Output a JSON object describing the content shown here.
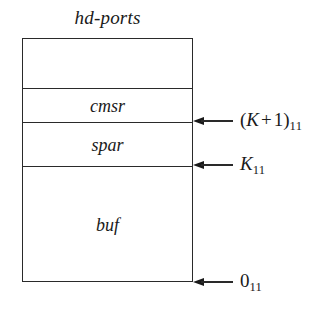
{
  "diagram": {
    "title": "hd-ports",
    "segments": [
      {
        "name": "unlabeled-top",
        "label": ""
      },
      {
        "name": "cmsr",
        "label": "cmsr"
      },
      {
        "name": "spar",
        "label": "spar"
      },
      {
        "name": "buf",
        "label": "buf"
      }
    ],
    "annotations": [
      {
        "name": "k-plus-one",
        "open_paren": "(",
        "variable": "K",
        "operator": "+",
        "operand": "1",
        "close_paren": ")",
        "subscript": "11"
      },
      {
        "name": "k",
        "variable": "K",
        "subscript": "11"
      },
      {
        "name": "zero",
        "value": "0",
        "subscript": "11"
      }
    ],
    "colors": {
      "background": "#ffffff",
      "stroke": "#2a2a2a",
      "text": "#1a1a1a"
    }
  }
}
